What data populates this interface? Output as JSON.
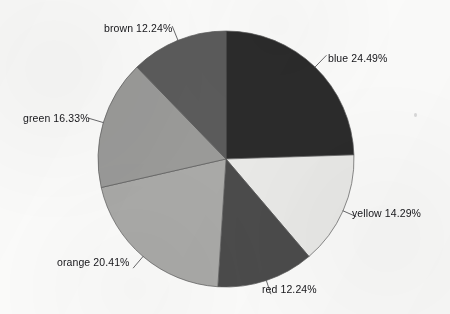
{
  "chart_data": {
    "type": "pie",
    "title": "",
    "subtitle": "",
    "xlabel": "",
    "ylabel": "",
    "legend_position": "none",
    "grid": false,
    "labels_format": "name percent",
    "start_angle_deg": 0,
    "direction": "clockwise",
    "categories": [
      "blue",
      "yellow",
      "red",
      "orange",
      "green",
      "brown"
    ],
    "values": [
      24.49,
      14.29,
      12.24,
      20.41,
      16.33,
      12.24
    ],
    "units": "percent",
    "slices": [
      {
        "name": "blue",
        "percent": 24.49,
        "label": "blue 24.49%",
        "fill": "#2b2b2b",
        "start_deg": 0.0,
        "sweep_deg": 88.16,
        "label_side": "right"
      },
      {
        "name": "yellow",
        "percent": 14.29,
        "label": "yellow 14.29%",
        "fill": "#e9e9e7",
        "start_deg": 88.16,
        "sweep_deg": 51.44,
        "label_side": "right"
      },
      {
        "name": "red",
        "percent": 12.24,
        "label": "red 12.24%",
        "fill": "#4b4b4b",
        "start_deg": 139.6,
        "sweep_deg": 44.06,
        "label_side": "bottom"
      },
      {
        "name": "orange",
        "percent": 20.41,
        "label": "orange 20.41%",
        "fill": "#a9a9a7",
        "start_deg": 183.66,
        "sweep_deg": 73.48,
        "label_side": "left"
      },
      {
        "name": "green",
        "percent": 16.33,
        "label": "green 16.33%",
        "fill": "#9a9a98",
        "start_deg": 257.14,
        "sweep_deg": 58.79,
        "label_side": "left"
      },
      {
        "name": "brown",
        "percent": 12.24,
        "label": "brown 12.24%",
        "fill": "#5b5b5b",
        "start_deg": 315.93,
        "sweep_deg": 44.06,
        "label_side": "top"
      }
    ],
    "geometry": {
      "center_x": 226,
      "center_y": 159,
      "radius": 128
    },
    "colors": {
      "blue": "#2b2b2b",
      "yellow": "#e9e9e7",
      "red": "#4b4b4b",
      "orange": "#a9a9a7",
      "green": "#9a9a98",
      "brown": "#5b5b5b",
      "outline": "#5a5a5a",
      "leader": "#58585a",
      "text": "#16161a",
      "background": "#fbfbfa"
    }
  }
}
